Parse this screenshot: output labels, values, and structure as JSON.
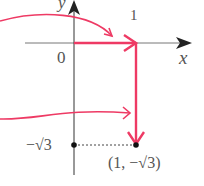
{
  "diagram": {
    "axis_labels": {
      "x": "x",
      "y": "y"
    },
    "origin_label": "0",
    "tick_x_label": "1",
    "tick_y_label": "−√3",
    "point_label": "(1, −√3)",
    "colors": {
      "arrow": "#ee3a64",
      "axis": "#333333",
      "text": "#555555",
      "dotted": "#444444"
    },
    "elements": [
      {
        "type": "arrow",
        "from": [
          0,
          0
        ],
        "to": [
          1,
          0
        ],
        "desc": "horizontal arrow along x-axis from origin to x=1"
      },
      {
        "type": "arrow",
        "from": [
          1,
          0
        ],
        "to": [
          1,
          -1.732
        ],
        "desc": "vertical arrow down from (1,0) to (1,−√3)"
      },
      {
        "type": "curved-arrow",
        "desc": "pointer from left into first arrow"
      },
      {
        "type": "curved-arrow",
        "desc": "pointer from left into second arrow"
      },
      {
        "type": "point",
        "at": [
          0,
          -1.732
        ]
      },
      {
        "type": "point",
        "at": [
          1,
          -1.732
        ]
      },
      {
        "type": "dotted-line",
        "from": [
          0,
          -1.732
        ],
        "to": [
          1,
          -1.732
        ]
      }
    ]
  }
}
